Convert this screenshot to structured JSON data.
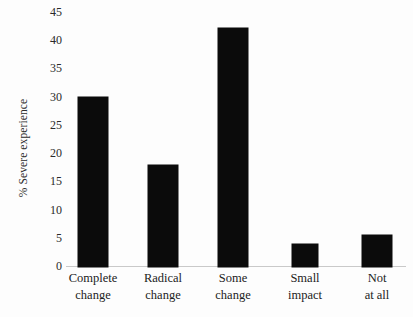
{
  "chart_data": {
    "type": "bar",
    "title": "",
    "xlabel": "",
    "ylabel": "% Severe experience",
    "ylim": [
      0,
      45
    ],
    "grid": false,
    "legend": false,
    "yticks": [
      45,
      40,
      35,
      30,
      25,
      20,
      15,
      10,
      5,
      0
    ],
    "categories": [
      "Complete change",
      "Radical change",
      "Some change",
      "Small impact",
      "Not at all"
    ],
    "category_lines": [
      [
        "Complete",
        "change"
      ],
      [
        "Radical",
        "change"
      ],
      [
        "Some",
        "change"
      ],
      [
        "Small",
        "impact"
      ],
      [
        "Not",
        "at all"
      ]
    ],
    "values": [
      30.2,
      18.1,
      42.4,
      4.0,
      5.6
    ],
    "bar_color": "#0b0b0b",
    "background_color": "#fdfdfd",
    "axis_color": "#c9c9c9"
  }
}
